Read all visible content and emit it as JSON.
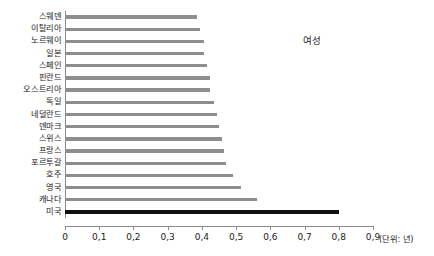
{
  "chart_data": {
    "type": "bar",
    "orientation": "horizontal",
    "title": "",
    "subtitle": "",
    "xlabel": "",
    "ylabel": "",
    "unit_note": "(단위: 년)",
    "annotation": "여성",
    "xlim": [
      0,
      0.9
    ],
    "grid": false,
    "legend": "none",
    "tick_labels": [
      "0",
      "0,1",
      "0,2",
      "0,3",
      "0,4",
      "0,5",
      "0,6",
      "0,7",
      "0,8",
      "0,9"
    ],
    "tick_values": [
      0,
      0.1,
      0.2,
      0.3,
      0.4,
      0.5,
      0.6,
      0.7,
      0.8,
      0.9
    ],
    "categories": [
      "스웨덴",
      "이탈리아",
      "노르웨이",
      "일본",
      "스페인",
      "핀란드",
      "오스트리아",
      "독일",
      "네덜란드",
      "덴마크",
      "스위스",
      "프랑스",
      "포르투갈",
      "호주",
      "영국",
      "캐나다",
      "미국"
    ],
    "values": [
      0.385,
      0.395,
      0.405,
      0.405,
      0.415,
      0.425,
      0.425,
      0.435,
      0.445,
      0.45,
      0.46,
      0.465,
      0.47,
      0.49,
      0.515,
      0.56,
      0.8
    ],
    "highlight_index": 16,
    "colors": {
      "bar": "#8e8e8e",
      "highlight_bar": "#111111",
      "axis": "#8a8a8a",
      "text": "#1a1a1a",
      "background": "#ffffff"
    }
  }
}
